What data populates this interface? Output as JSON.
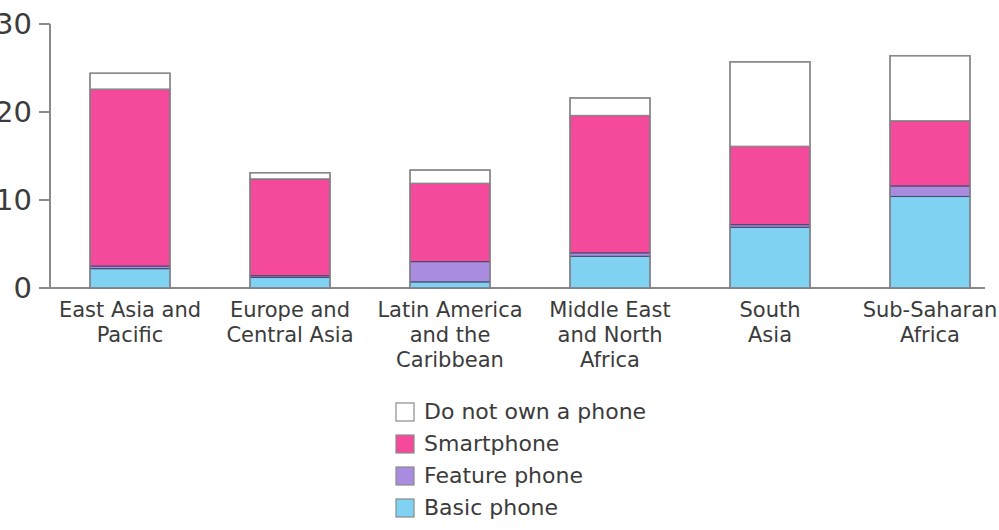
{
  "chart_data": {
    "type": "bar",
    "subtype": "stacked-bar",
    "title": "",
    "subtitle": "",
    "xlabel": "",
    "ylabel": "",
    "ylim": [
      0,
      30
    ],
    "yticks": [
      0,
      10,
      20,
      30
    ],
    "ytick_labels": [
      "0",
      "10",
      "20",
      "30"
    ],
    "grid": false,
    "legend_position": "bottom-center",
    "categories": [
      "East Asia and Pacific",
      "Europe and Central Asia",
      "Latin America and the Caribbean",
      "Middle East and North Africa",
      "South Asia",
      "Sub-Saharan Africa"
    ],
    "category_lines": [
      [
        "East Asia and",
        "Pacific"
      ],
      [
        "Europe and",
        "Central Asia"
      ],
      [
        "Latin America",
        "and the",
        "Caribbean"
      ],
      [
        "Middle East",
        "and North",
        "Africa"
      ],
      [
        "South",
        "Asia"
      ],
      [
        "Sub-Saharan",
        "Africa"
      ]
    ],
    "stack_order_bottom_to_top": [
      "Basic phone",
      "Feature phone",
      "Smartphone",
      "Do not own a phone"
    ],
    "series": [
      {
        "name": "Basic phone",
        "color": "#80D2F2",
        "values": [
          2.2,
          1.2,
          0.7,
          3.6,
          6.9,
          10.4
        ]
      },
      {
        "name": "Feature phone",
        "color": "#A98BE0",
        "values": [
          0.3,
          0.2,
          2.3,
          0.4,
          0.3,
          1.2
        ]
      },
      {
        "name": "Smartphone",
        "color": "#F5499B",
        "values": [
          20.1,
          11.0,
          8.9,
          15.6,
          8.9,
          7.4
        ]
      },
      {
        "name": "Do not own a phone",
        "color": "#FFFFFF",
        "values": [
          1.8,
          0.7,
          1.5,
          2.0,
          9.6,
          7.4
        ]
      }
    ],
    "totals": [
      24.4,
      13.1,
      13.4,
      21.6,
      25.7,
      26.4
    ],
    "legend_entries": [
      {
        "label": "Do not own a phone",
        "color": "#FFFFFF"
      },
      {
        "label": "Smartphone",
        "color": "#F5499B"
      },
      {
        "label": "Feature phone",
        "color": "#A98BE0"
      },
      {
        "label": "Basic phone",
        "color": "#80D2F2"
      }
    ]
  }
}
